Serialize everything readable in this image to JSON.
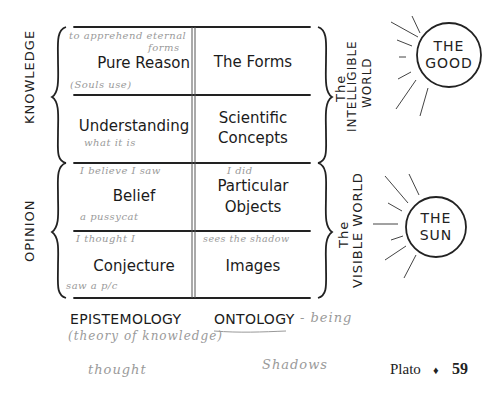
{
  "left_groups": [
    {
      "label": "KNOWLEDGE"
    },
    {
      "label": "OPINION"
    }
  ],
  "right_groups": [
    {
      "line1": "The",
      "line2": "INTELLIGIBLE",
      "line3": "WORLD"
    },
    {
      "line1": "The",
      "line2": "VISIBLE WORLD"
    }
  ],
  "table": {
    "rows": [
      {
        "left": "Pure Reason",
        "right_lines": [
          "The Forms"
        ],
        "note_top": "to apprehend eternal",
        "note_top2": "forms",
        "note_bottom": "(Souls use)",
        "right_note": ""
      },
      {
        "left": "Understanding",
        "right_lines": [
          "Scientific",
          "Concepts"
        ],
        "note_top": "",
        "note_bottom": "what it is",
        "right_note": ""
      },
      {
        "left": "Belief",
        "right_lines": [
          "Particular",
          "Objects"
        ],
        "note_top": "I believe I saw",
        "note_bottom": "a pussycat",
        "right_note": "I did"
      },
      {
        "left": "Conjecture",
        "right_lines": [
          "Images"
        ],
        "note_top": "I thought I",
        "note_bottom": "saw a p/c",
        "right_note": "sees the shadow"
      }
    ]
  },
  "suns": [
    {
      "line1": "THE",
      "line2": "GOOD"
    },
    {
      "line1": "THE",
      "line2": "SUN"
    }
  ],
  "bottom": {
    "epistemology": "EPISTEMOLOGY",
    "ontology": "ONTOLOGY",
    "ontology_note": "- being",
    "epistemology_note": "(theory of knowledge)",
    "thought_note": "thought",
    "shadows_note": "Shadows"
  },
  "footer": {
    "running_head": "Plato",
    "separator": "♦",
    "page_number": "59"
  }
}
